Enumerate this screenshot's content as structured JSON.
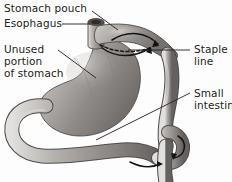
{
  "figure": {
    "background_color": "#fdfdfd",
    "ink_color": "#231f20",
    "style": "grayscale medical illustration with leader-line callouts"
  },
  "labels": [
    {
      "id": "stomach-pouch",
      "text": "Stomach pouch",
      "x": 4,
      "y": 3,
      "align": "left"
    },
    {
      "id": "esophagus",
      "text": "Esophagus",
      "x": 4,
      "y": 18,
      "align": "left"
    },
    {
      "id": "unused-1",
      "text": "Unused",
      "x": 4,
      "y": 44,
      "align": "left"
    },
    {
      "id": "unused-2",
      "text": "portion",
      "x": 4,
      "y": 56,
      "align": "left"
    },
    {
      "id": "unused-3",
      "text": "of stomach",
      "x": 4,
      "y": 68,
      "align": "left"
    },
    {
      "id": "staple-1",
      "text": "Staple",
      "x": 194,
      "y": 44,
      "align": "left"
    },
    {
      "id": "staple-2",
      "text": "line",
      "x": 194,
      "y": 56,
      "align": "left"
    },
    {
      "id": "small-int-1",
      "text": "Small",
      "x": 194,
      "y": 88,
      "align": "left"
    },
    {
      "id": "small-int-2",
      "text": "intestine",
      "x": 194,
      "y": 100,
      "align": "left"
    }
  ],
  "leader_lines": [
    {
      "id": "leader-stomach-pouch",
      "from": [
        92,
        11
      ],
      "to": [
        118,
        30
      ]
    },
    {
      "id": "leader-esophagus",
      "from": [
        62,
        24
      ],
      "to": [
        90,
        24
      ]
    },
    {
      "id": "leader-unused",
      "from": [
        58,
        50
      ],
      "to": [
        96,
        78
      ]
    },
    {
      "id": "leader-staple",
      "from": [
        190,
        50
      ],
      "to": [
        128,
        50
      ]
    },
    {
      "id": "leader-small-int",
      "from": [
        190,
        93
      ],
      "to": [
        96,
        140
      ]
    }
  ],
  "anatomy": {
    "parts": [
      {
        "name": "esophagus",
        "description": "vertical tube entering stomach pouch at top"
      },
      {
        "name": "stomach-pouch",
        "description": "small upper pouch above staple line"
      },
      {
        "name": "staple-line",
        "description": "dashed line separating pouch from remnant stomach"
      },
      {
        "name": "unused-stomach",
        "description": "large bypassed remnant stomach body"
      },
      {
        "name": "duodenum-loop",
        "description": "loop curving left and down from remnant stomach"
      },
      {
        "name": "roux-limb",
        "description": "vertical jejunal limb from pouch to anastomosis"
      },
      {
        "name": "small-intestine",
        "description": "jejunum running right and exiting bottom"
      },
      {
        "name": "anastomosis",
        "description": "junction of roux limb and small intestine"
      }
    ],
    "flow_arrows": [
      {
        "id": "arrow-pouch-outflow",
        "description": "curved arrow from pouch into roux limb"
      },
      {
        "id": "arrow-remnant-flow",
        "description": "curved arrow along remnant stomach"
      },
      {
        "id": "arrow-anastomosis",
        "description": "circular arrow at intestinal junction"
      },
      {
        "id": "arrow-distal-flow",
        "description": "arrow along distal small intestine"
      }
    ]
  }
}
